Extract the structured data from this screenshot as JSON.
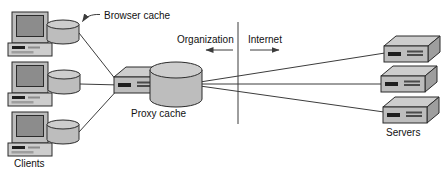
{
  "diagram": {
    "labels": {
      "browser_cache": "Browser cache",
      "clients": "Clients",
      "proxy_cache": "Proxy cache",
      "organization": "Organization",
      "internet": "Internet",
      "servers": "Servers"
    },
    "colors": {
      "background": "#ffffff",
      "outline": "#2b2b2b",
      "line": "#3c3c3c",
      "text": "#111111",
      "top": "#cdcdcd",
      "mid": "#bdbdbd",
      "side": "#9e9e9e",
      "screen": "#8c8c8c",
      "slot": "#1f1f1f",
      "vent": "#4a4a4a"
    }
  }
}
